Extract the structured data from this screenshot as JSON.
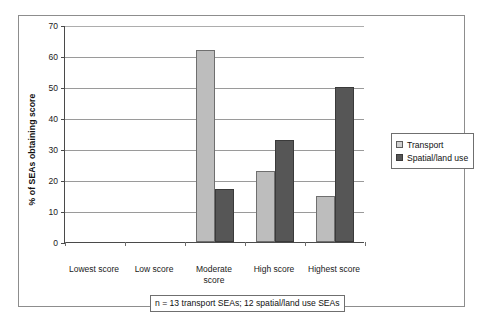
{
  "chart_data": {
    "type": "bar",
    "title": "",
    "subtitle": "",
    "xlabel": "",
    "ylabel": "% of SEAs obtaining score",
    "categories": [
      "Lowest score",
      "Low score",
      "Moderate score",
      "High score",
      "Highest score"
    ],
    "series": [
      {
        "name": "Transport",
        "values": [
          0,
          0,
          62,
          23,
          15
        ],
        "color": "#bdbdbd"
      },
      {
        "name": "Spatial/land use",
        "values": [
          0,
          0,
          17,
          33,
          50
        ],
        "color": "#565656"
      }
    ],
    "ylim": [
      0,
      70
    ],
    "yticks": [
      0,
      10,
      20,
      30,
      40,
      50,
      60,
      70
    ],
    "ytick_labels": [
      "0",
      "10",
      "20",
      "30",
      "40",
      "50",
      "60",
      "70"
    ],
    "grid": "horizontal",
    "legend_position": "right",
    "annotation": "n = 13 transport SEAs; 12 spatial/land use SEAs"
  },
  "legend": {
    "items": [
      {
        "label": "Transport",
        "swatch": "transport"
      },
      {
        "label": "Spatial/land use",
        "swatch": "spatial"
      }
    ]
  },
  "caption": {
    "text": "n = 13 transport SEAs; 12 spatial/land use SEAs"
  }
}
